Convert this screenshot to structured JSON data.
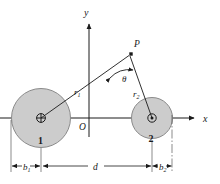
{
  "figure": {
    "background_color": "#ffffff",
    "line_color": "#1a1a1a",
    "conductor_fill": "#cccccc",
    "conductor_stroke": "#7a7a7a"
  },
  "axes": {
    "x_label": "x",
    "y_label": "y",
    "origin_label": "O",
    "x_axis": {
      "x1": 0,
      "y1": 118,
      "x2": 196,
      "y2": 118
    },
    "y_axis": {
      "x1": 89,
      "y1": 137,
      "x2": 89,
      "y2": 22
    },
    "x_label_pos": {
      "x": 206,
      "y": 121
    },
    "y_label_pos": {
      "x": 86,
      "y": 15
    },
    "origin_label_pos": {
      "x": 80,
      "y": 128
    }
  },
  "conductors": [
    {
      "name": "conductor-1",
      "label": "1",
      "label_pos": {
        "x": 41,
        "y": 141
      },
      "center": {
        "x": 41,
        "y": 118
      },
      "radius": 30,
      "current_direction": "into-page",
      "marker": "crossed-circle"
    },
    {
      "name": "conductor-2",
      "label": "2",
      "label_pos": {
        "x": 152,
        "y": 139
      },
      "center": {
        "x": 152,
        "y": 118
      },
      "radius": 21,
      "current_direction": "out-of-page",
      "marker": "dotted-circle"
    }
  ],
  "field_point": {
    "label": "P",
    "label_pos": {
      "x": 133,
      "y": 43
    },
    "pos": {
      "x": 131,
      "y": 54
    }
  },
  "vectors": [
    {
      "name": "r1",
      "label": "r",
      "subscript": "1",
      "label_pos": {
        "x": 76,
        "y": 93
      },
      "from": {
        "x": 41,
        "y": 118
      },
      "to": {
        "x": 131,
        "y": 54
      }
    },
    {
      "name": "r2",
      "label": "r",
      "subscript": "2",
      "label_pos": {
        "x": 135,
        "y": 95
      },
      "from": {
        "x": 152,
        "y": 118
      },
      "to": {
        "x": 131,
        "y": 54
      }
    }
  ],
  "angle": {
    "label": "θ",
    "label_pos": {
      "x": 126,
      "y": 79
    },
    "vertex": {
      "x": 131,
      "y": 54
    },
    "description": "angle at P between r1 and r2"
  },
  "dimensions": [
    {
      "name": "b1",
      "label": "b",
      "subscript": "1",
      "label_pos": {
        "x": 26,
        "y": 170
      },
      "start_x": 11,
      "end_x": 41,
      "y": 166
    },
    {
      "name": "d",
      "label": "d",
      "subscript": "",
      "label_pos": {
        "x": 96,
        "y": 169
      },
      "start_x": 41,
      "end_x": 152,
      "y": 166
    },
    {
      "name": "b2",
      "label": "b",
      "subscript": "2",
      "label_pos": {
        "x": 162,
        "y": 170
      },
      "start_x": 152,
      "end_x": 172,
      "y": 166
    }
  ]
}
